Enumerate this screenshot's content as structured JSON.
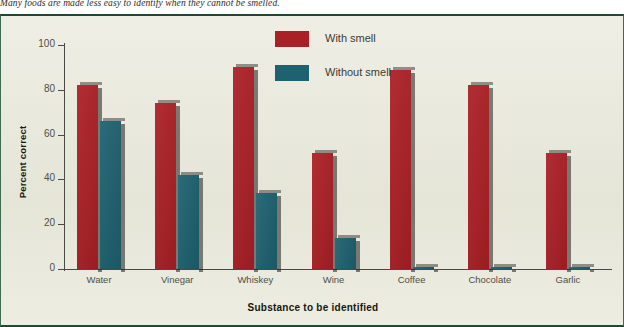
{
  "caption": "Many foods are made less easy to identify when they cannot be smelled.",
  "figure": {
    "ylabel": "Percent correct",
    "xlabel": "Substance to be identified",
    "legend": {
      "with_smell": "With smell",
      "without_smell": "Without smell"
    },
    "colors": {
      "with_smell": "#ab2026",
      "without_smell": "#1e6170",
      "background": "#e9e9dc",
      "border": "#1d4a33",
      "axis": "#4a4a44"
    }
  },
  "chart_data": {
    "type": "bar",
    "title": "",
    "subtitle": "",
    "xlabel": "Substance to be identified",
    "ylabel": "Percent correct",
    "ylim": [
      0,
      100
    ],
    "yticks": [
      0,
      20,
      40,
      60,
      80,
      100
    ],
    "grid": false,
    "legend_position": "top-center",
    "categories": [
      "Water",
      "Vinegar",
      "Whiskey",
      "Wine",
      "Coffee",
      "Chocolate",
      "Garlic"
    ],
    "series": [
      {
        "name": "With smell",
        "color": "#ab2026",
        "values": [
          82,
          74,
          90,
          52,
          89,
          82,
          52
        ]
      },
      {
        "name": "Without smell",
        "color": "#1e6170",
        "values": [
          66,
          42,
          34,
          14,
          1,
          1,
          1
        ]
      }
    ]
  }
}
